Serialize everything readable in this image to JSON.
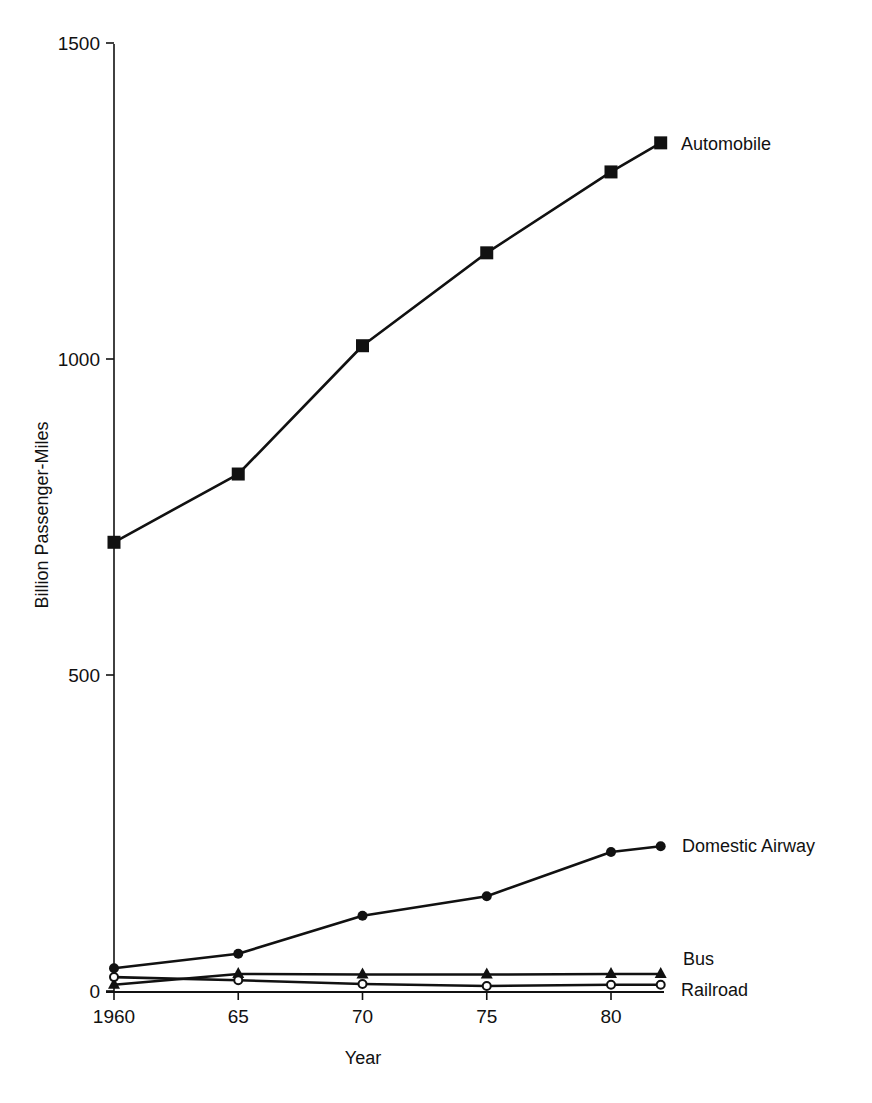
{
  "chart_data": {
    "type": "line",
    "title": "",
    "xlabel": "Year",
    "ylabel": "Billion Passenger-Miles",
    "x": [
      1960,
      1965,
      1970,
      1975,
      1980,
      1982
    ],
    "xtick_values": [
      1960,
      1965,
      1970,
      1975,
      1980
    ],
    "xtick_labels": [
      "1960",
      "65",
      "70",
      "75",
      "80"
    ],
    "ytick_values": [
      0,
      500,
      1000,
      1500
    ],
    "ytick_labels": [
      "0",
      "500",
      "1000",
      "1500"
    ],
    "ylim": [
      0,
      1500
    ],
    "xlim": [
      1960,
      1982
    ],
    "grid": false,
    "legend_position": "direct labels at right end of lines",
    "series": [
      {
        "name": "Automobile",
        "marker": "square-filled",
        "values": [
          710,
          818,
          1021,
          1168,
          1296,
          1342
        ]
      },
      {
        "name": "Domestic Airway",
        "marker": "circle-filled",
        "values": [
          36,
          59,
          119,
          150,
          220,
          229
        ]
      },
      {
        "name": "Bus",
        "marker": "triangle-filled",
        "values": [
          10,
          27,
          26,
          26,
          27,
          27
        ]
      },
      {
        "name": "Railroad",
        "marker": "circle-open",
        "values": [
          22,
          17,
          11,
          8,
          10,
          10
        ]
      }
    ]
  }
}
